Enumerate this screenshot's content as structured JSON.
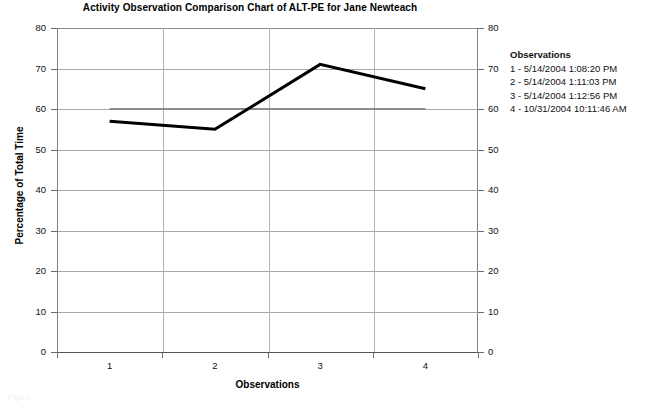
{
  "chart_data": {
    "type": "line",
    "title": "Activity Observation Comparison Chart of ALT-PE for Jane Newteach",
    "xlabel": "Observations",
    "ylabel": "Percentage of Total Time",
    "categories": [
      "1",
      "2",
      "3",
      "4"
    ],
    "x": [
      1,
      2,
      3,
      4
    ],
    "ylim": [
      0,
      80
    ],
    "yticks": [
      0,
      10,
      20,
      30,
      40,
      50,
      60,
      70,
      80
    ],
    "y_axis_right": true,
    "yticks_right": [
      0,
      10,
      20,
      30,
      40,
      50,
      60,
      70,
      80
    ],
    "grid": true,
    "legend_position": "right",
    "series": [
      {
        "name": "ALT-PE",
        "values": [
          57,
          55,
          71,
          65
        ],
        "color": "#000000",
        "line_width": 3
      },
      {
        "name": "Criterion",
        "values": [
          60,
          60,
          60,
          60
        ],
        "color": "#8c8c8c",
        "line_width": 2
      }
    ],
    "legend": {
      "title": "Observations",
      "entries": [
        "1 - 5/14/2004 1:08:20 PM",
        "2 - 5/14/2004 1:11:03 PM",
        "3 - 5/14/2004 1:12:56 PM",
        "4 - 10/31/2004 10:11:46 AM"
      ]
    }
  },
  "caption": {
    "text": "Figure"
  }
}
